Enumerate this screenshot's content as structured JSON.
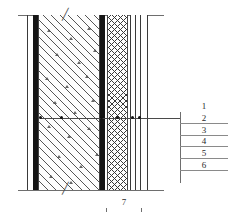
{
  "drawing": {
    "type": "wall-cross-section",
    "title": "",
    "break_symbol": "╱"
  },
  "legend": {
    "orientation": "vertical-stack",
    "items": [
      {
        "num": "1"
      },
      {
        "num": "2"
      },
      {
        "num": "3"
      },
      {
        "num": "4"
      },
      {
        "num": "5"
      },
      {
        "num": "6"
      }
    ]
  },
  "dimension": {
    "value": "7"
  },
  "layers": [
    {
      "id": "l1",
      "kind": "line",
      "x": 27,
      "w": 1,
      "fill": "#3a3a3a"
    },
    {
      "id": "l2",
      "kind": "black",
      "x": 33,
      "w": 5,
      "fill": "#151515"
    },
    {
      "id": "l3",
      "kind": "concrete",
      "x": 38,
      "w": 62,
      "fill": "#fdfdfd"
    },
    {
      "id": "l4",
      "kind": "black",
      "x": 100,
      "w": 5,
      "fill": "#151515"
    },
    {
      "id": "l5",
      "kind": "xhatch",
      "x": 107,
      "w": 21,
      "fill": "#ffffff"
    },
    {
      "id": "l6",
      "kind": "thin",
      "x": 130,
      "w": 18,
      "fill": "#ffffff"
    }
  ],
  "colors": {
    "ink": "#1a1a1a",
    "rule": "#6e6e6e",
    "solid": "#151515",
    "hatch": "#3a3a3a"
  }
}
